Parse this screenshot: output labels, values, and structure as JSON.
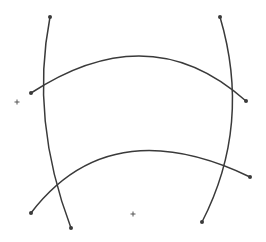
{
  "diagram": {
    "width": 266,
    "height": 242,
    "background": "#ffffff",
    "stroke_color": "#3a3a3a",
    "curves": [
      {
        "id": "left-vertical",
        "d": "M 50 17 Q 30 120 71 228",
        "start": [
          50,
          17
        ],
        "end": [
          71,
          228
        ]
      },
      {
        "id": "right-vertical",
        "d": "M 220 17 Q 252 125 202 222",
        "start": [
          220,
          17
        ],
        "end": [
          202,
          222
        ]
      },
      {
        "id": "upper-arc",
        "d": "M 31 93 Q 150 15 246 101",
        "start": [
          31,
          93
        ],
        "end": [
          246,
          101
        ]
      },
      {
        "id": "lower-arc",
        "d": "M 31 213 Q 110 110 250 177",
        "start": [
          31,
          213
        ],
        "end": [
          250,
          177
        ]
      }
    ],
    "markers": [
      {
        "id": "marker-left",
        "x": 17,
        "y": 102
      },
      {
        "id": "marker-bottom",
        "x": 133,
        "y": 214
      }
    ]
  }
}
